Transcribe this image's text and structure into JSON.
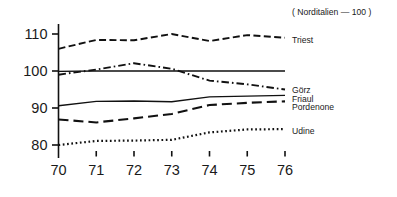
{
  "note": "( Norditalien — 100 )",
  "chart_data": {
    "type": "line",
    "title": "",
    "subtitle": "",
    "annotation": "( Norditalien — 100 )",
    "xlabel": "",
    "ylabel": "",
    "x": [
      70,
      71,
      72,
      73,
      74,
      75,
      76
    ],
    "categories": [
      "70",
      "71",
      "72",
      "73",
      "74",
      "75",
      "76"
    ],
    "xtick_labels": [
      "70",
      "71",
      "72",
      "73",
      "74",
      "75",
      "76"
    ],
    "ytick_labels": [
      "110",
      "100",
      "90",
      "80"
    ],
    "yticks": [
      110,
      100,
      90,
      80
    ],
    "ylim": [
      76,
      113
    ],
    "xlim": [
      69.7,
      76.9
    ],
    "grid": false,
    "legend_position": "right-inline",
    "series": [
      {
        "name": "Triest",
        "label": "Triest",
        "style": "dashed",
        "color": "#111111",
        "values": [
          106.0,
          108.4,
          108.3,
          110.0,
          108.1,
          109.7,
          109.0
        ]
      },
      {
        "name": "Görz",
        "label": "Görz",
        "style": "dash-dot",
        "color": "#111111",
        "values": [
          99.0,
          100.4,
          102.1,
          100.6,
          97.4,
          96.4,
          95.0
        ]
      },
      {
        "name": "Friaul",
        "label": "Friaul",
        "style": "solid",
        "color": "#111111",
        "values": [
          99.9,
          100.0,
          100.0,
          100.0,
          100.0,
          100.0,
          100.0
        ]
      },
      {
        "name": "Pordenone",
        "label": "Pordenone",
        "style": "solid",
        "color": "#111111",
        "values": [
          90.6,
          91.8,
          91.9,
          91.7,
          93.0,
          93.2,
          93.4
        ]
      },
      {
        "name": "Friaul-long-dash",
        "label": "",
        "style": "long-dash",
        "color": "#111111",
        "values": [
          86.9,
          86.1,
          87.2,
          88.4,
          90.8,
          91.4,
          91.8
        ]
      },
      {
        "name": "Udine",
        "label": "Udine",
        "style": "dotted",
        "color": "#111111",
        "values": [
          80.0,
          81.1,
          81.2,
          81.4,
          83.4,
          84.2,
          84.3
        ]
      }
    ],
    "series_labels": [
      {
        "text": "Triest",
        "y_value": 109.0
      },
      {
        "text": "Görz",
        "y_value": 95.4
      },
      {
        "text": "Friaul",
        "y_value": 93.4
      },
      {
        "text": "Pordenone",
        "y_value": 91.4
      },
      {
        "text": "Udine",
        "y_value": 84.3
      }
    ]
  }
}
